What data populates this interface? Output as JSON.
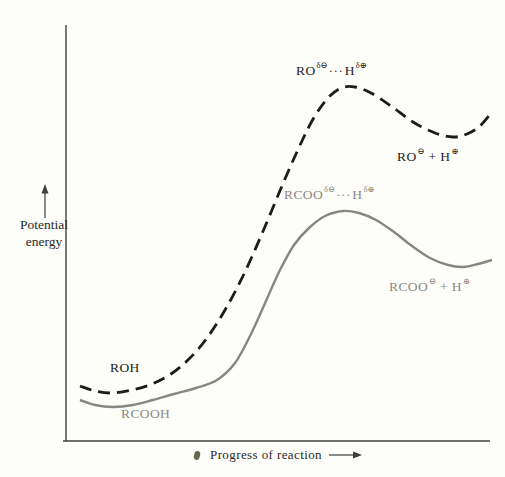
{
  "colors": {
    "background": "#fdfdf9",
    "axis": "#3f3f3f",
    "text_dark": "#1f1f1f",
    "text_gray": "#8b8a84",
    "smudge": "#55563b",
    "curve_roh": "#1c1c1c",
    "curve_rcooh": "#87867f"
  },
  "labels": {
    "roh_reactant": "ROH",
    "rcooh_reactant": "RCOOH",
    "roh_ts": {
      "base": "RO",
      "sup1": "δ⊖",
      "dots": "···",
      "h": "H",
      "sup2": "δ⊕"
    },
    "rcoo_ts": {
      "base": "RCOO",
      "sup1": "δ⊖",
      "dots": "···",
      "h": "H",
      "sup2": "δ⊕"
    },
    "ro_products": {
      "base": "RO",
      "sup1": "⊖",
      "mid": " + H",
      "sup2": "⊕"
    },
    "rcoo_products": {
      "base": "RCOO",
      "sup1": "⊖",
      "mid": " + H",
      "sup2": "⊕"
    }
  },
  "chart_data": {
    "type": "line",
    "title": "",
    "xlabel": "Progress of reaction",
    "ylabel": "Potential energy",
    "ylabel_lines": [
      "Potential",
      "energy"
    ],
    "x_axis_numeric": false,
    "y_axis_numeric": false,
    "grid": false,
    "legend": "inline-labels",
    "series": [
      {
        "id": "roh-curve",
        "name": "ROH ionization",
        "line_style": "dashed",
        "dash": "12 7",
        "stroke_width": 2.8,
        "color": "#1c1c1c",
        "points_px": [
          [
            80,
            386
          ],
          [
            95,
            391
          ],
          [
            112,
            393
          ],
          [
            132,
            390
          ],
          [
            152,
            384
          ],
          [
            171,
            374
          ],
          [
            189,
            359
          ],
          [
            207,
            338
          ],
          [
            225,
            310
          ],
          [
            243,
            276
          ],
          [
            261,
            236
          ],
          [
            279,
            193
          ],
          [
            296,
            154
          ],
          [
            312,
            121
          ],
          [
            327,
            99
          ],
          [
            341,
            88
          ],
          [
            355,
            87
          ],
          [
            371,
            93
          ],
          [
            391,
            106
          ],
          [
            413,
            122
          ],
          [
            435,
            133
          ],
          [
            453,
            137
          ],
          [
            467,
            134
          ],
          [
            480,
            126
          ],
          [
            492,
            112
          ]
        ],
        "annotations": [
          {
            "text": "ROH",
            "role": "reactant",
            "position": "start"
          },
          {
            "text": "RO(δ⊖)···H(δ⊕)",
            "role": "transition-state",
            "position": "peak",
            "note": "higher activation energy"
          },
          {
            "text": "RO⊖ + H⊕",
            "role": "products",
            "position": "end",
            "note": "products higher in energy"
          }
        ]
      },
      {
        "id": "rcooh-curve",
        "name": "RCOOH ionization",
        "line_style": "solid",
        "dash": "",
        "stroke_width": 2.4,
        "color": "#87867f",
        "points_px": [
          [
            80,
            400
          ],
          [
            95,
            405
          ],
          [
            113,
            407
          ],
          [
            133,
            405
          ],
          [
            153,
            400
          ],
          [
            174,
            394
          ],
          [
            196,
            388
          ],
          [
            217,
            380
          ],
          [
            235,
            363
          ],
          [
            251,
            334
          ],
          [
            266,
            301
          ],
          [
            280,
            270
          ],
          [
            294,
            245
          ],
          [
            309,
            228
          ],
          [
            325,
            216
          ],
          [
            343,
            211
          ],
          [
            359,
            213
          ],
          [
            376,
            220
          ],
          [
            394,
            232
          ],
          [
            412,
            246
          ],
          [
            430,
            258
          ],
          [
            448,
            265
          ],
          [
            463,
            267
          ],
          [
            478,
            264
          ],
          [
            492,
            260
          ]
        ],
        "annotations": [
          {
            "text": "RCOOH",
            "role": "reactant",
            "position": "start"
          },
          {
            "text": "RCOO(δ⊖)···H(δ⊕)",
            "role": "transition-state",
            "position": "peak",
            "note": "lower activation energy"
          },
          {
            "text": "RCOO⊖ + H⊕",
            "role": "products",
            "position": "end",
            "note": "products lower in energy"
          }
        ]
      }
    ]
  }
}
